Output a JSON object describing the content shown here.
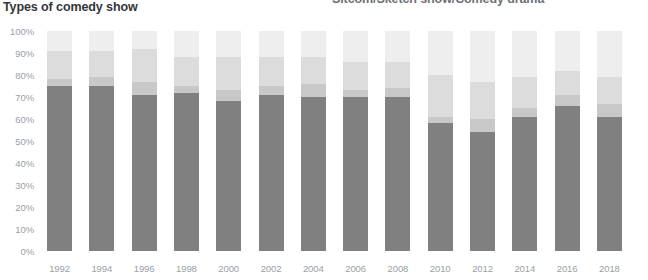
{
  "header": {
    "title": "Types of comedy show",
    "right_label": "Sitcom/Sketch show/Comedy drama"
  },
  "colors": {
    "series_1": "#808080",
    "series_2": "#c8c8c8",
    "series_3": "#dcdcdc",
    "series_4": "#eeeeee",
    "axis_text": "#9aa0a6",
    "title_text": "#33373b",
    "header_right_text": "#6e7174",
    "background": "#ffffff"
  },
  "chart_data": {
    "type": "bar",
    "stacked": true,
    "title": "Types of comedy show",
    "subtitle": "Sitcom/Sketch show/Comedy drama",
    "xlabel": "",
    "ylabel": "",
    "ylim": [
      0,
      100
    ],
    "grid": false,
    "legend_position": "none",
    "categories": [
      "1992",
      "1994",
      "1996",
      "1998",
      "2000",
      "2002",
      "2004",
      "2006",
      "2008",
      "2010",
      "2012",
      "2014",
      "2016",
      "2018"
    ],
    "ytick_labels": [
      "100%",
      "90%",
      "80%",
      "70%",
      "60%",
      "50%",
      "40%",
      "30%",
      "20%",
      "10%",
      "0%"
    ],
    "ytick_values": [
      100,
      90,
      80,
      70,
      60,
      50,
      40,
      30,
      20,
      10,
      0
    ],
    "series": [
      {
        "name": "Sitcom",
        "color": "#808080",
        "values": [
          75,
          75,
          71,
          72,
          68,
          71,
          70,
          70,
          70,
          58,
          54,
          61,
          66,
          61
        ]
      },
      {
        "name": "Sketch show",
        "color": "#c8c8c8",
        "values": [
          3,
          4,
          6,
          3,
          5,
          4,
          6,
          3,
          4,
          3,
          6,
          4,
          5,
          6
        ]
      },
      {
        "name": "Comedy drama",
        "color": "#dcdcdc",
        "values": [
          13,
          12,
          15,
          13,
          15,
          13,
          12,
          13,
          12,
          19,
          17,
          14,
          11,
          12
        ]
      },
      {
        "name": "Other",
        "color": "#eeeeee",
        "values": [
          9,
          9,
          8,
          12,
          12,
          12,
          12,
          14,
          14,
          20,
          23,
          21,
          18,
          21
        ]
      }
    ]
  }
}
